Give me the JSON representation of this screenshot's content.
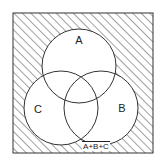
{
  "diagram": {
    "type": "venn",
    "frame": {
      "x": 13,
      "y": 13,
      "width": 140,
      "height": 140,
      "hatched": true
    },
    "sets": [
      {
        "label": "A",
        "cx": 79,
        "cy": 66,
        "r": 37,
        "label_x": 79,
        "label_y": 40
      },
      {
        "label": "B",
        "cx": 101,
        "cy": 108,
        "r": 37,
        "label_x": 122,
        "label_y": 108
      },
      {
        "label": "C",
        "cx": 61,
        "cy": 108,
        "r": 37,
        "label_x": 38,
        "label_y": 109
      }
    ],
    "complement_label": "A+B+C",
    "complement_label_pos": {
      "x": 96,
      "y": 145
    },
    "colors": {
      "stroke": "#333333",
      "hatch": "#444444",
      "background": "#ffffff"
    }
  }
}
